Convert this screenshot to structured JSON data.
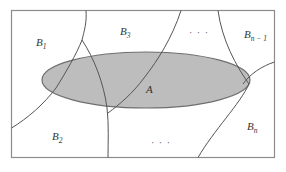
{
  "diagram": {
    "type": "partition-venn",
    "colors": {
      "frame": "#8c8c8c",
      "curve": "#555555",
      "ellipse_fill": "#bdbdbd",
      "ellipse_stroke": "#6e6e6e"
    },
    "set_label": "A",
    "partition_labels": [
      {
        "main": "B",
        "sub": "1"
      },
      {
        "main": "B",
        "sub": "2"
      },
      {
        "main": "B",
        "sub": "3"
      },
      {
        "main": "B",
        "sub": "n − 1"
      },
      {
        "main": "B",
        "sub": "n"
      }
    ],
    "ellipsis_top": "· · ·",
    "ellipsis_bottom": "· · ·"
  }
}
